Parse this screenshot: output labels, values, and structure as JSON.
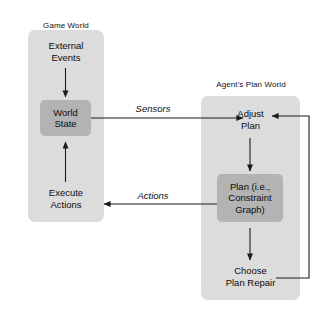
{
  "diagram": {
    "background_color": "#ffffff",
    "panel_color": "#dcdcdc",
    "node_box_color": "#b3b3b3",
    "arrow_color": "#1a1a1a",
    "panels": [
      {
        "id": "game-world",
        "caption": "Game World",
        "nodes": [
          {
            "id": "external-events",
            "label_line1": "External",
            "label_line2": "Events",
            "style": "plain"
          },
          {
            "id": "world-state",
            "label_line1": "World",
            "label_line2": "State",
            "style": "boxed"
          },
          {
            "id": "execute-actions",
            "label_line1": "Execute",
            "label_line2": "Actions",
            "style": "plain"
          }
        ]
      },
      {
        "id": "agents-plan-world",
        "caption": "Agent's Plan World",
        "nodes": [
          {
            "id": "adjust-plan",
            "label_line1": "Adjust",
            "label_line2": "Plan",
            "style": "plain"
          },
          {
            "id": "plan-constraint-graph",
            "label_line1": "Plan (i.e.,",
            "label_line2": "Constraint",
            "label_line3": "Graph)",
            "style": "boxed"
          },
          {
            "id": "choose-plan-repair",
            "label_line1": "Choose",
            "label_line2": "Plan Repair",
            "style": "plain"
          }
        ]
      }
    ],
    "edge_labels": [
      {
        "id": "sensors",
        "label": "Sensors"
      },
      {
        "id": "actions",
        "label": "Actions"
      }
    ],
    "connections": [
      {
        "id": "external-events-to-world-state",
        "from": "external-events",
        "to": "world-state",
        "label": ""
      },
      {
        "id": "world-state-to-adjust-plan",
        "from": "world-state",
        "to": "adjust-plan",
        "label": "Sensors"
      },
      {
        "id": "execute-actions-to-world-state",
        "from": "execute-actions",
        "to": "world-state",
        "label": ""
      },
      {
        "id": "plan-to-execute-actions",
        "from": "plan-constraint-graph",
        "to": "execute-actions",
        "label": "Actions"
      },
      {
        "id": "adjust-plan-to-plan",
        "from": "adjust-plan",
        "to": "plan-constraint-graph",
        "label": ""
      },
      {
        "id": "plan-to-choose-plan-repair",
        "from": "plan-constraint-graph",
        "to": "choose-plan-repair",
        "label": ""
      },
      {
        "id": "choose-plan-repair-to-adjust-plan",
        "from": "choose-plan-repair",
        "to": "adjust-plan",
        "label": ""
      }
    ]
  }
}
